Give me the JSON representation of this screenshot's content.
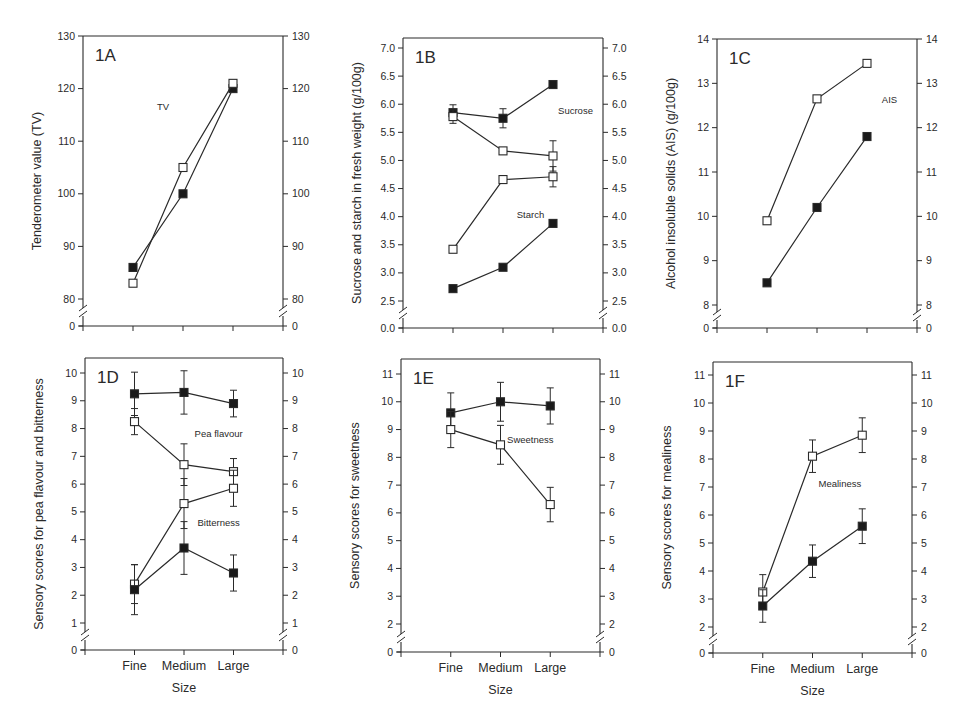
{
  "figure": {
    "colors": {
      "line": "#2a2a2a",
      "filled_marker": "#1a1a1a",
      "open_marker": "#ffffff",
      "background": "#ffffff"
    },
    "x_axis_title": "Size",
    "categories": [
      "Fine",
      "Medium",
      "Large"
    ]
  },
  "chart_data": [
    {
      "id": "1A",
      "type": "line",
      "panel_label": "1A",
      "ylabel": "Tenderometer value (TV)",
      "categories": [
        "Fine",
        "Medium",
        "Large"
      ],
      "yticks": [
        80,
        90,
        100,
        110,
        120,
        130
      ],
      "ylim": [
        80,
        130
      ],
      "axis_break": true,
      "break_base_label": "0",
      "show_x_labels": false,
      "xlabel": "",
      "annotations": [
        {
          "text": "TV",
          "x": 0.6,
          "y": 116
        }
      ],
      "series": [
        {
          "name": "TV (filled)",
          "marker": "filled",
          "values": [
            86,
            100,
            120
          ],
          "errors": [
            null,
            null,
            null
          ]
        },
        {
          "name": "TV (open)",
          "marker": "open",
          "values": [
            83,
            105,
            121
          ],
          "errors": [
            null,
            null,
            null
          ]
        }
      ],
      "frame": {
        "left": 83,
        "right": 283,
        "top": 36,
        "axis_bottom": 326,
        "y_top_px": 36,
        "y_bottom_px": 299,
        "break_y": 312
      }
    },
    {
      "id": "1B",
      "type": "line",
      "panel_label": "1B",
      "ylabel": "Sucrose and starch in fresh weight (g/100g)",
      "categories": [
        "Fine",
        "Medium",
        "Large"
      ],
      "yticks": [
        2.5,
        3.0,
        3.5,
        4.0,
        4.5,
        5.0,
        5.5,
        6.0,
        6.5,
        7.0
      ],
      "ytick_format": 1,
      "ylim": [
        2.5,
        7.0
      ],
      "axis_break": true,
      "break_base_label": "0.0",
      "show_x_labels": false,
      "xlabel": "",
      "annotations": [
        {
          "text": "Sucrose",
          "x": 2.45,
          "y": 5.82
        },
        {
          "text": "Starch",
          "x": 1.55,
          "y": 3.98
        }
      ],
      "series": [
        {
          "name": "Sucrose (filled)",
          "marker": "filled",
          "values": [
            5.85,
            5.75,
            6.35
          ],
          "errors": [
            0.14,
            0.17,
            0.07
          ]
        },
        {
          "name": "Sucrose (open)",
          "marker": "open",
          "values": [
            5.78,
            5.17,
            5.08
          ],
          "errors": [
            0.12,
            0.06,
            0.27
          ]
        },
        {
          "name": "Starch (open)",
          "marker": "open",
          "values": [
            3.42,
            4.66,
            4.71
          ],
          "errors": [
            0.04,
            0.03,
            0.18
          ]
        },
        {
          "name": "Starch (filled)",
          "marker": "filled",
          "values": [
            2.72,
            3.1,
            3.88
          ],
          "errors": [
            null,
            null,
            null
          ]
        }
      ],
      "frame": {
        "left": 403,
        "right": 603,
        "top": 38,
        "axis_bottom": 328,
        "y_top_px": 48,
        "y_bottom_px": 301,
        "break_y": 314
      }
    },
    {
      "id": "1C",
      "type": "line",
      "panel_label": "1C",
      "ylabel": "Alcohol insoluble solids (AIS) (g/100g)",
      "categories": [
        "Fine",
        "Medium",
        "Large"
      ],
      "yticks": [
        8,
        9,
        10,
        11,
        12,
        13,
        14
      ],
      "ylim": [
        8,
        14
      ],
      "axis_break": true,
      "break_base_label": "0",
      "show_x_labels": false,
      "xlabel": "",
      "annotations": [
        {
          "text": "AIS",
          "x": 2.45,
          "y": 12.55
        }
      ],
      "series": [
        {
          "name": "AIS (open)",
          "marker": "open",
          "values": [
            9.9,
            12.65,
            13.45
          ],
          "errors": [
            null,
            null,
            0.05
          ]
        },
        {
          "name": "AIS (filled)",
          "marker": "filled",
          "values": [
            8.5,
            10.2,
            11.8
          ],
          "errors": [
            null,
            null,
            null
          ]
        }
      ],
      "frame": {
        "left": 717,
        "right": 917,
        "top": 39,
        "axis_bottom": 328,
        "y_top_px": 39,
        "y_bottom_px": 305,
        "break_y": 316
      }
    },
    {
      "id": "1D",
      "type": "line",
      "panel_label": "1D",
      "ylabel": "Sensory scores for pea flavour and bitterness",
      "categories": [
        "Fine",
        "Medium",
        "Large"
      ],
      "yticks": [
        1,
        2,
        3,
        4,
        5,
        6,
        7,
        8,
        9,
        10
      ],
      "ylim": [
        1,
        10
      ],
      "axis_break": true,
      "break_base_label": "0",
      "show_x_labels": true,
      "xlabel": "Size",
      "annotations": [
        {
          "text": "Pea flavour",
          "x": 1.7,
          "y": 7.7
        },
        {
          "text": "Bitterness",
          "x": 1.7,
          "y": 4.5
        }
      ],
      "series": [
        {
          "name": "Pea flavour (filled)",
          "marker": "filled",
          "values": [
            9.25,
            9.3,
            8.9
          ],
          "errors": [
            0.78,
            0.78,
            0.48
          ]
        },
        {
          "name": "Pea flavour (open)",
          "marker": "open",
          "values": [
            8.25,
            6.7,
            6.45
          ],
          "errors": [
            0.47,
            0.75,
            0.47
          ]
        },
        {
          "name": "Bitterness (open)",
          "marker": "open",
          "values": [
            2.4,
            5.3,
            5.85
          ],
          "errors": [
            0.7,
            0.9,
            0.65
          ]
        },
        {
          "name": "Bitterness (filled)",
          "marker": "filled",
          "values": [
            2.2,
            3.7,
            2.8
          ],
          "errors": [
            0.9,
            0.95,
            0.65
          ]
        }
      ],
      "frame": {
        "left": 85,
        "right": 283,
        "top": 358,
        "axis_bottom": 650,
        "y_top_px": 373,
        "y_bottom_px": 623,
        "break_y": 636
      }
    },
    {
      "id": "1E",
      "type": "line",
      "panel_label": "1E",
      "ylabel": "Sensory scores for sweetness",
      "categories": [
        "Fine",
        "Medium",
        "Large"
      ],
      "yticks": [
        2,
        3,
        4,
        5,
        6,
        7,
        8,
        9,
        10,
        11
      ],
      "ylim": [
        2,
        11
      ],
      "axis_break": true,
      "break_base_label": "0",
      "show_x_labels": true,
      "xlabel": "Size",
      "annotations": [
        {
          "text": "Sweetness",
          "x": 1.6,
          "y": 8.5
        }
      ],
      "series": [
        {
          "name": "Sweetness (filled)",
          "marker": "filled",
          "values": [
            9.6,
            10.0,
            9.85
          ],
          "errors": [
            0.72,
            0.7,
            0.65
          ]
        },
        {
          "name": "Sweetness (open)",
          "marker": "open",
          "values": [
            9.0,
            8.45,
            6.3
          ],
          "errors": [
            0.65,
            0.7,
            0.62
          ]
        }
      ],
      "frame": {
        "left": 401,
        "right": 600,
        "top": 359,
        "axis_bottom": 652,
        "y_top_px": 374,
        "y_bottom_px": 624,
        "break_y": 638
      }
    },
    {
      "id": "1F",
      "type": "line",
      "panel_label": "1F",
      "ylabel": "Sensory scores for mealiness",
      "categories": [
        "Fine",
        "Medium",
        "Large"
      ],
      "yticks": [
        2,
        3,
        4,
        5,
        6,
        7,
        8,
        9,
        10,
        11
      ],
      "ylim": [
        2,
        11
      ],
      "axis_break": true,
      "break_base_label": "0",
      "show_x_labels": true,
      "xlabel": "Size",
      "annotations": [
        {
          "text": "Mealiness",
          "x": 1.55,
          "y": 7.0
        }
      ],
      "series": [
        {
          "name": "Mealiness (open)",
          "marker": "open",
          "values": [
            3.25,
            8.1,
            8.85
          ],
          "errors": [
            0.62,
            0.58,
            0.62
          ]
        },
        {
          "name": "Mealiness (filled)",
          "marker": "filled",
          "values": [
            2.75,
            4.35,
            5.6
          ],
          "errors": [
            0.58,
            0.58,
            0.62
          ]
        }
      ],
      "frame": {
        "left": 713,
        "right": 912,
        "top": 362,
        "axis_bottom": 653,
        "y_top_px": 375,
        "y_bottom_px": 627,
        "break_y": 640
      }
    }
  ]
}
